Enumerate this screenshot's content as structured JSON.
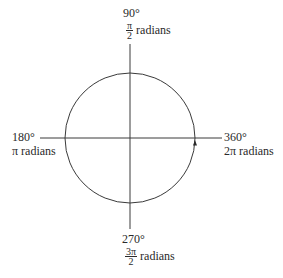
{
  "diagram": {
    "type": "unit-circle-angles",
    "circle": {
      "cx": 130,
      "cy": 138,
      "r": 65
    },
    "axes": {
      "vertical": {
        "x": 130,
        "y1": 44,
        "y2": 229
      },
      "horizontal": {
        "y": 138,
        "x1": 40,
        "x2": 222
      }
    },
    "arrow": {
      "position": "360 degree point",
      "direction": "counterclockwise (up)"
    },
    "colors": {
      "line": "#3a3a3a",
      "text": "#2a2a2a"
    }
  },
  "labels": {
    "top": {
      "degrees": "90°",
      "rad_num": "π",
      "rad_den": "2",
      "rad_word": "radians"
    },
    "left": {
      "degrees": "180°",
      "radians": "π radians"
    },
    "right": {
      "degrees": "360°",
      "radians": "2π radians"
    },
    "bottom": {
      "degrees": "270°",
      "rad_num": "3π",
      "rad_den": "2",
      "rad_word": "radians"
    }
  }
}
